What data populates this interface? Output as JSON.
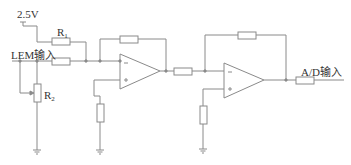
{
  "diagram": {
    "type": "circuit-schematic",
    "colors": {
      "wire": "#8a8a8a",
      "text": "#333333",
      "background": "#ffffff"
    },
    "labels": {
      "supply": "2.5V",
      "r1": "R",
      "r1_sub": "1",
      "input": "LEM输入",
      "r2": "R",
      "r2_sub": "2",
      "output": "A/D输入"
    },
    "opamps": [
      {
        "id": "U1",
        "inverting": "−",
        "non_inverting": "+"
      },
      {
        "id": "U2",
        "inverting": "−",
        "non_inverting": "+"
      }
    ],
    "components": [
      "R1 (2.5V offset resistor)",
      "input resistor",
      "R2 potentiometer to ground",
      "U1 feedback resistor",
      "U1 non-inverting ground resistor",
      "inter-stage resistor",
      "U2 feedback resistor",
      "U2 non-inverting ground resistor",
      "output series resistor"
    ]
  }
}
